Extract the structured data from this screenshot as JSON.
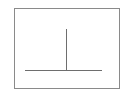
{
  "diagram": {
    "frame": {
      "x": 14,
      "y": 8,
      "width": 106,
      "height": 81,
      "color": "#8a8a8a"
    },
    "baseline": {
      "x1": 25,
      "x2": 102,
      "y": 70,
      "color": "#6e6e6e"
    },
    "stem": {
      "x": 66,
      "y1": 29,
      "y2": 70,
      "color": "#6e6e6e"
    }
  }
}
